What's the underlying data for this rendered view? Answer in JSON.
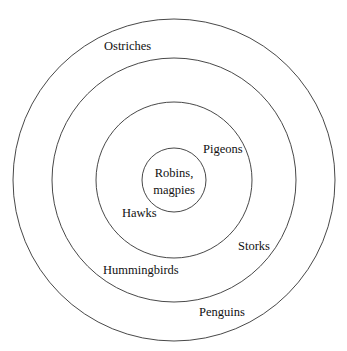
{
  "diagram": {
    "type": "concentric-circles",
    "center": {
      "x": 174,
      "y": 180
    },
    "rings": [
      {
        "name": "outer",
        "radius": 162
      },
      {
        "name": "second",
        "radius": 122
      },
      {
        "name": "third",
        "radius": 78
      },
      {
        "name": "inner",
        "radius": 32
      }
    ],
    "labels": {
      "ostriches": "Ostriches",
      "pigeons": "Pigeons",
      "robins": "Robins,",
      "magpies": "magpies",
      "hawks": "Hawks",
      "storks": "Storks",
      "hummingbirds": "Hummingbirds",
      "penguins": "Penguins"
    },
    "stroke_color": "#333333",
    "background": "#ffffff"
  }
}
